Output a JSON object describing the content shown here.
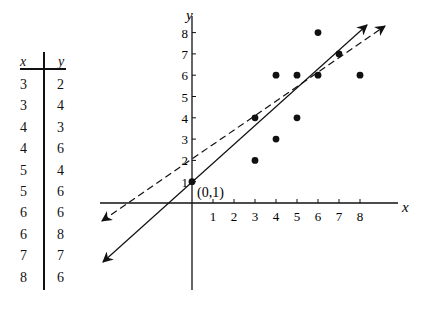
{
  "table": {
    "headers": [
      "x",
      "y"
    ],
    "rows": [
      [
        3,
        2
      ],
      [
        3,
        4
      ],
      [
        4,
        3
      ],
      [
        4,
        6
      ],
      [
        5,
        4
      ],
      [
        5,
        6
      ],
      [
        6,
        6
      ],
      [
        6,
        8
      ],
      [
        7,
        7
      ],
      [
        8,
        6
      ]
    ]
  },
  "chart_data": {
    "type": "scatter",
    "title": "",
    "xlabel": "x",
    "ylabel": "y",
    "x_ticks": [
      "1",
      "2",
      "3",
      "4",
      "5",
      "6",
      "7",
      "8"
    ],
    "y_ticks": [
      "1",
      "2",
      "3",
      "4",
      "5",
      "6",
      "7",
      "8"
    ],
    "points": [
      [
        3,
        2
      ],
      [
        3,
        4
      ],
      [
        4,
        3
      ],
      [
        4,
        6
      ],
      [
        5,
        4
      ],
      [
        5,
        6
      ],
      [
        6,
        6
      ],
      [
        6,
        8
      ],
      [
        7,
        7
      ],
      [
        8,
        6
      ],
      [
        0,
        1
      ]
    ],
    "annotations": [
      {
        "text": "(0,1)",
        "x": 0,
        "y": 1
      }
    ],
    "lines": [
      {
        "name": "solid-line",
        "style": "solid",
        "through": [
          [
            0,
            1
          ],
          [
            7,
            7
          ]
        ]
      },
      {
        "name": "dashed-line",
        "style": "dashed",
        "approx_intercept": 2,
        "approx_slope": 0.72
      }
    ],
    "grid": false
  },
  "labels": {
    "x_axis": "x",
    "y_axis": "y",
    "origin_point": "(0,1)"
  }
}
